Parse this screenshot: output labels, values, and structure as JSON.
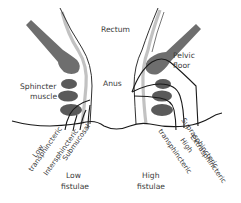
{
  "diagram": {
    "labels": {
      "rectum": "Rectum",
      "pelvic_floor_line1": "Pelvic",
      "pelvic_floor_line2": "floor",
      "sphincter_line1": "Sphincter",
      "sphincter_line2": "muscle",
      "anus": "Anus",
      "low_fistulae_line1": "Low",
      "low_fistulae_line2": "fistulae",
      "high_fistulae_line1": "High",
      "high_fistulae_line2": "fistulae"
    },
    "fistula_types_low": [
      {
        "line1": "Low",
        "line2": "transphincteric"
      },
      {
        "line1": "Intersphincteric"
      },
      {
        "line1": "Submucosal"
      }
    ],
    "fistula_types_high": [
      {
        "line1": "High",
        "line2": "transphincteric"
      },
      {
        "line1": "Suprasphincteric"
      },
      {
        "line1": "Extrasphincteric"
      }
    ],
    "colors": {
      "muscle_dark": "#5a5a5a",
      "muscle_medium": "#6e6e6e",
      "mucosa_light": "#c2c2c2",
      "outline": "#1a1a1a",
      "text": "#3a3a3a",
      "background": "#ffffff"
    }
  }
}
